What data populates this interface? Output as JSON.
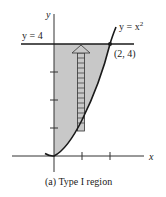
{
  "figure": {
    "caption": "(a) Type I region",
    "axis_labels": {
      "x": "x",
      "y": "y"
    },
    "line_label": "y = 4",
    "curve_label": {
      "lhs": "y = x",
      "exp": "2"
    },
    "point_label": "(2, 4)",
    "colors": {
      "region_fill": "#c8c8c8",
      "ink": "#1a1a1a",
      "strip_fill": "#c8c8c8"
    },
    "x_ticks": [
      1,
      2
    ],
    "y_ticks": [
      1,
      2,
      3
    ]
  }
}
